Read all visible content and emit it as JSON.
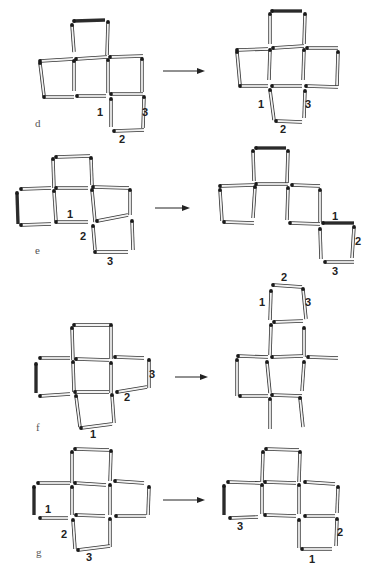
{
  "figure": {
    "type": "matchstick-puzzle",
    "panels": [
      {
        "id": "d",
        "label": "d",
        "label_pos": [
          35,
          127
        ],
        "arrow": {
          "x1": 163,
          "x2": 205,
          "y": 71
        },
        "left": {
          "matches": [
            [
              74,
              21,
              105,
              20,
              1
            ],
            [
              72,
              25,
              74,
              52,
              0
            ],
            [
              108,
              22,
              107,
              55,
              0
            ],
            [
              40,
              61,
              73,
              59,
              0
            ],
            [
              76,
              59,
              107,
              57,
              0
            ],
            [
              110,
              57,
              143,
              56,
              0
            ],
            [
              40,
              63,
              44,
              96,
              0
            ],
            [
              74,
              61,
              74,
              91,
              0
            ],
            [
              108,
              60,
              108,
              93,
              0
            ],
            [
              142,
              59,
              142,
              92,
              0
            ],
            [
              44,
              97,
              74,
              97,
              0
            ],
            [
              77,
              96,
              106,
              96,
              0
            ],
            [
              111,
              94,
              143,
              94,
              0
            ],
            [
              111,
              99,
              111,
              127,
              0
            ],
            [
              144,
              97,
              143,
              128,
              0
            ],
            [
              114,
              131,
              144,
              130,
              0
            ]
          ],
          "numbers": [
            {
              "text": "1",
              "x": 100,
              "y": 116
            },
            {
              "text": "3",
              "x": 145,
              "y": 116
            },
            {
              "text": "2",
              "x": 122,
              "y": 143
            }
          ]
        },
        "right": {
          "matches": [
            [
              272,
              11,
              302,
              11,
              1
            ],
            [
              270,
              14,
              270,
              44,
              0
            ],
            [
              305,
              14,
              304,
              44,
              0
            ],
            [
              237,
              50,
              268,
              49,
              0
            ],
            [
              273,
              48,
              304,
              46,
              0
            ],
            [
              307,
              48,
              338,
              48,
              0
            ],
            [
              237,
              52,
              240,
              85,
              0
            ],
            [
              270,
              50,
              269,
              80,
              0
            ],
            [
              304,
              50,
              303,
              80,
              0
            ],
            [
              338,
              52,
              337,
              86,
              0
            ],
            [
              240,
              86,
              268,
              86,
              0
            ],
            [
              272,
              86,
              302,
              86,
              0
            ],
            [
              306,
              86,
              338,
              87,
              0
            ],
            [
              270,
              90,
              274,
              120,
              0
            ],
            [
              305,
              91,
              304,
              118,
              0
            ],
            [
              276,
              121,
              302,
              122,
              0
            ]
          ],
          "numbers": [
            {
              "text": "1",
              "x": 261,
              "y": 108
            },
            {
              "text": "3",
              "x": 308,
              "y": 108
            },
            {
              "text": "2",
              "x": 283,
              "y": 133
            }
          ]
        }
      },
      {
        "id": "e",
        "label": "e",
        "label_pos": [
          35,
          254
        ],
        "arrow": {
          "x1": 155,
          "x2": 190,
          "y": 208
        },
        "left": {
          "matches": [
            [
              56,
              157,
              90,
              156,
              0
            ],
            [
              53,
              159,
              54,
              188,
              0
            ],
            [
              91,
              158,
              92,
              185,
              0
            ],
            [
              21,
              189,
              51,
              188,
              0
            ],
            [
              56,
              188,
              88,
              188,
              0
            ],
            [
              93,
              187,
              129,
              188,
              0
            ],
            [
              17,
              193,
              18,
              224,
              1
            ],
            [
              54,
              191,
              56,
              221,
              0
            ],
            [
              92,
              190,
              95,
              222,
              0
            ],
            [
              130,
              190,
              130,
              215,
              0
            ],
            [
              21,
              225,
              51,
              224,
              0
            ],
            [
              56,
              222,
              88,
              222,
              0
            ],
            [
              97,
              221,
              128,
              215,
              0
            ],
            [
              93,
              226,
              95,
              250,
              0
            ],
            [
              132,
              221,
              133,
              250,
              0
            ],
            [
              95,
              252,
              128,
              252,
              0
            ]
          ],
          "numbers": [
            {
              "text": "1",
              "x": 70,
              "y": 218
            },
            {
              "text": "2",
              "x": 83,
              "y": 240
            },
            {
              "text": "3",
              "x": 110,
              "y": 265
            }
          ]
        },
        "right": {
          "matches": [
            [
              256,
              148,
              286,
              148,
              1
            ],
            [
              253,
              151,
              254,
              181,
              0
            ],
            [
              288,
              151,
              287,
              183,
              0
            ],
            [
              220,
              186,
              254,
              185,
              0
            ],
            [
              256,
              184,
              288,
              184,
              0
            ],
            [
              292,
              185,
              320,
              186,
              0
            ],
            [
              220,
              190,
              222,
              221,
              0
            ],
            [
              255,
              187,
              253,
              218,
              0
            ],
            [
              288,
              188,
              287,
              220,
              0
            ],
            [
              320,
              190,
              320,
              222,
              0
            ],
            [
              224,
              222,
              254,
              223,
              0
            ],
            [
              290,
              223,
              320,
              224,
              0
            ],
            [
              323,
              223,
              354,
              223,
              1
            ],
            [
              320,
              229,
              321,
              259,
              0
            ],
            [
              354,
              227,
              352,
              258,
              0
            ],
            [
              325,
              262,
              354,
              262,
              0
            ]
          ],
          "numbers": [
            {
              "text": "1",
              "x": 335,
              "y": 220
            },
            {
              "text": "2",
              "x": 358,
              "y": 245
            },
            {
              "text": "3",
              "x": 335,
              "y": 275
            }
          ]
        }
      },
      {
        "id": "f",
        "label": "f",
        "label_pos": [
          36,
          431
        ],
        "arrow": {
          "x1": 175,
          "x2": 208,
          "y": 377
        },
        "left": {
          "matches": [
            [
              74,
              325,
              110,
              325,
              0
            ],
            [
              72,
              328,
              73,
              360,
              0
            ],
            [
              111,
              325,
              111,
              359,
              0
            ],
            [
              40,
              358,
              70,
              358,
              0
            ],
            [
              76,
              359,
              109,
              360,
              0
            ],
            [
              115,
              357,
              144,
              358,
              0
            ],
            [
              36,
              364,
              36,
              393,
              1
            ],
            [
              73,
              362,
              74,
              392,
              0
            ],
            [
              111,
              363,
              111,
              393,
              0
            ],
            [
              149,
              360,
              149,
              388,
              0
            ],
            [
              40,
              396,
              70,
              394,
              0
            ],
            [
              75,
              392,
              109,
              392,
              0
            ],
            [
              117,
              392,
              147,
              387,
              0
            ],
            [
              76,
              396,
              80,
              427,
              0
            ],
            [
              112,
              395,
              114,
              423,
              0
            ],
            [
              81,
              428,
              112,
              424,
              0
            ]
          ],
          "numbers": [
            {
              "text": "3",
              "x": 152,
              "y": 378
            },
            {
              "text": "2",
              "x": 127,
              "y": 401
            },
            {
              "text": "1",
              "x": 93,
              "y": 438
            }
          ]
        },
        "right": {
          "matches": [
            [
              273,
              285,
              302,
              287,
              0
            ],
            [
              271,
              291,
              270,
              320,
              0
            ],
            [
              303,
              289,
              306,
              319,
              0
            ],
            [
              274,
              322,
              303,
              321,
              0
            ],
            [
              271,
              325,
              270,
              355,
              0
            ],
            [
              304,
              328,
              304,
              357,
              0
            ],
            [
              238,
              356,
              268,
              357,
              0
            ],
            [
              272,
              357,
              303,
              356,
              0
            ],
            [
              308,
              357,
              338,
              358,
              0
            ],
            [
              237,
              360,
              237,
              396,
              0
            ],
            [
              267,
              362,
              270,
              393,
              0
            ],
            [
              304,
              362,
              302,
              391,
              0
            ],
            [
              240,
              396,
              268,
              396,
              0
            ],
            [
              272,
              395,
              302,
              396,
              0
            ],
            [
              270,
              399,
              270,
              429,
              0
            ],
            [
              300,
              398,
              303,
              427,
              0
            ]
          ],
          "numbers": [
            {
              "text": "2",
              "x": 284,
              "y": 281
            },
            {
              "text": "1",
              "x": 262,
              "y": 306
            },
            {
              "text": "3",
              "x": 308,
              "y": 306
            }
          ]
        }
      },
      {
        "id": "g",
        "label": "g",
        "label_pos": [
          36,
          556
        ],
        "arrow": {
          "x1": 163,
          "x2": 205,
          "y": 500
        },
        "left": {
          "matches": [
            [
              75,
              449,
              109,
              450,
              0
            ],
            [
              72,
              452,
              72,
              483,
              0
            ],
            [
              111,
              451,
              110,
              481,
              0
            ],
            [
              38,
              483,
              70,
              483,
              0
            ],
            [
              75,
              483,
              106,
              485,
              0
            ],
            [
              115,
              481,
              144,
              483,
              0
            ],
            [
              34,
              487,
              34,
              515,
              1
            ],
            [
              72,
              487,
              72,
              515,
              0
            ],
            [
              110,
              485,
              110,
              515,
              0
            ],
            [
              149,
              487,
              148,
              515,
              0
            ],
            [
              40,
              518,
              68,
              518,
              0
            ],
            [
              76,
              515,
              105,
              516,
              0
            ],
            [
              116,
              516,
              146,
              516,
              0
            ],
            [
              73,
              520,
              75,
              549,
              0
            ],
            [
              110,
              519,
              110,
              547,
              0
            ],
            [
              78,
              550,
              110,
              546,
              0
            ]
          ],
          "numbers": [
            {
              "text": "1",
              "x": 48,
              "y": 513
            },
            {
              "text": "2",
              "x": 64,
              "y": 538
            },
            {
              "text": "3",
              "x": 89,
              "y": 561
            }
          ]
        },
        "right": {
          "matches": [
            [
              266,
              449,
              299,
              450,
              0
            ],
            [
              263,
              452,
              262,
              482,
              0
            ],
            [
              300,
              452,
              299,
              482,
              0
            ],
            [
              228,
              482,
              260,
              483,
              0
            ],
            [
              265,
              482,
              296,
              483,
              0
            ],
            [
              305,
              482,
              335,
              484,
              0
            ],
            [
              224,
              486,
              224,
              515,
              1
            ],
            [
              262,
              485,
              262,
              514,
              0
            ],
            [
              299,
              485,
              299,
              514,
              0
            ],
            [
              338,
              487,
              337,
              513,
              0
            ],
            [
              230,
              518,
              258,
              517,
              0
            ],
            [
              265,
              515,
              296,
              516,
              0
            ],
            [
              305,
              516,
              335,
              516,
              0
            ],
            [
              299,
              520,
              299,
              548,
              0
            ],
            [
              337,
              519,
              336,
              546,
              0
            ],
            [
              302,
              549,
              332,
              549,
              0
            ]
          ],
          "numbers": [
            {
              "text": "3",
              "x": 240,
              "y": 530
            },
            {
              "text": "2",
              "x": 340,
              "y": 536
            },
            {
              "text": "1",
              "x": 312,
              "y": 563
            }
          ]
        }
      }
    ],
    "colors": {
      "match_fill": "#f2f2f2",
      "match_stroke": "#333333",
      "match_head": "#1a1a1a",
      "dark_match": "#2a2a2a",
      "arrow": "#222222",
      "label": "#555555"
    }
  }
}
